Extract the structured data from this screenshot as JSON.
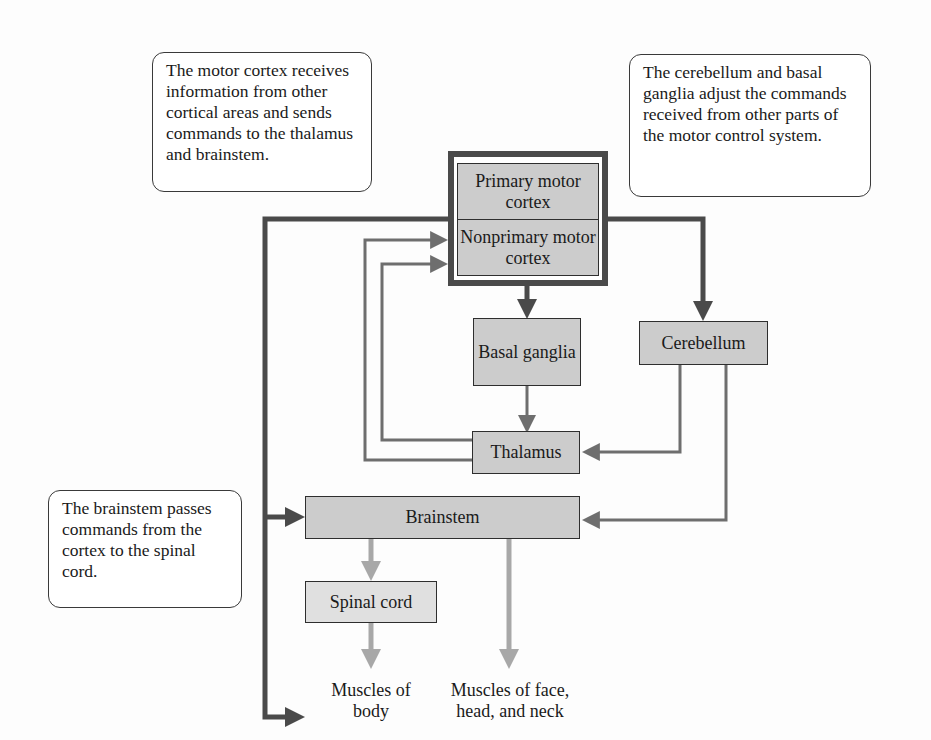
{
  "notes": {
    "motor_cortex": "The motor cortex receives information from other cortical areas and sends commands to the thalamus and brainstem.",
    "cerebellum_basal": "The cerebellum and basal ganglia adjust the commands received from other parts of the motor control system.",
    "brainstem": "The brainstem passes commands from the cortex to the spinal cord."
  },
  "nodes": {
    "primary_motor_cortex": "Primary motor cortex",
    "nonprimary_motor_cortex": "Nonprimary motor cortex",
    "basal_ganglia": "Basal ganglia",
    "cerebellum": "Cerebellum",
    "thalamus": "Thalamus",
    "brainstem": "Brainstem",
    "spinal_cord": "Spinal cord"
  },
  "outputs": {
    "muscles_body": "Muscles of body",
    "muscles_face": "Muscles of face, head, and neck"
  },
  "colors": {
    "box_fill": "#cccccc",
    "dark_arrow": "#4a4a4a",
    "medium_arrow": "#6e6e6e",
    "light_arrow": "#a8a8a8"
  }
}
